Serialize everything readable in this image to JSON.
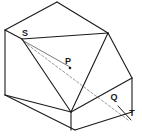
{
  "figure": {
    "kind": "isometric-solid-diagram",
    "background_color": "#ffffff",
    "stroke_color": "#1a1a1a",
    "dashed_stroke_color": "#9a9a9a",
    "thin_stroke_color": "#555555",
    "stroke_width": 1.1,
    "labels": [
      {
        "id": "S",
        "text": "S",
        "x": 25,
        "y": 34
      },
      {
        "id": "P",
        "text": "P",
        "x": 68,
        "y": 62
      },
      {
        "id": "Q",
        "text": "Q",
        "x": 114,
        "y": 98
      },
      {
        "id": "T",
        "text": "T",
        "x": 132,
        "y": 114
      }
    ],
    "vertices": {
      "left_top": [
        5,
        30
      ],
      "apex_top": [
        57,
        2
      ],
      "right_top": [
        108,
        33
      ],
      "left_bottom": [
        5,
        95
      ],
      "bottom_front": [
        75,
        130
      ],
      "right_slope_bottom": [
        132,
        78
      ],
      "right_bottom": [
        132,
        112
      ],
      "s_point": [
        22,
        39
      ],
      "ridge_front": [
        71,
        112
      ],
      "right_front_lower": [
        88,
        104
      ],
      "p_point": [
        70,
        68
      ],
      "t_point": [
        128,
        120
      ]
    },
    "outline_path": "M 5 30 L 57 2 L 108 33 L 132 78 L 132 112 L 75 130 L 5 95 Z",
    "edges": [
      {
        "name": "top-left-ridge",
        "d": "M 5 30 L 57 2"
      },
      {
        "name": "top-right-ridge",
        "d": "M 57 2 L 108 33"
      },
      {
        "name": "right-slope",
        "d": "M 108 33 L 132 78"
      },
      {
        "name": "right-vertical",
        "d": "M 132 78 L 132 112"
      },
      {
        "name": "bottom-right",
        "d": "M 132 112 L 75 130"
      },
      {
        "name": "bottom-left",
        "d": "M 75 130 L 5 95"
      },
      {
        "name": "left-vertical",
        "d": "M 5 95 L 5 30"
      },
      {
        "name": "top-face-front-left",
        "d": "M 22 39 L 5 30"
      },
      {
        "name": "top-face-front-right",
        "d": "M 22 39 L 108 33"
      },
      {
        "name": "slope-front-edge",
        "d": "M 108 33 L 71 112"
      },
      {
        "name": "wedge-front-left",
        "d": "M 22 39 L 71 112"
      },
      {
        "name": "front-vertical",
        "d": "M 71 112 L 71 130"
      },
      {
        "name": "base-inner-right",
        "d": "M 71 112 L 132 78"
      },
      {
        "name": "base-inner-left",
        "d": "M 71 112 L 5 95"
      }
    ],
    "thin_edges": [
      {
        "name": "inner-fan-line",
        "d": "M 22 40 L 70 67"
      }
    ],
    "dashed_edges": [
      {
        "name": "diagonal-s-to-t",
        "d": "M 24 42 L 128 120"
      }
    ],
    "tick_marks": [
      {
        "name": "t-tick",
        "d": "M 118 106 L 131 120"
      }
    ],
    "point_markers": [
      {
        "name": "p-marker",
        "x": 70,
        "y": 68,
        "r": 1.3
      }
    ]
  }
}
